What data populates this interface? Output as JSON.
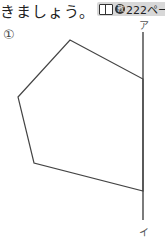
{
  "header": {
    "text": "きましょう。",
    "reference": {
      "icon": "book-icon",
      "mark": "教",
      "page": "222ペー"
    }
  },
  "problem": {
    "number": "①",
    "line_labels": {
      "top": "ア",
      "bottom": "イ"
    },
    "polygon_points": "70,40 143,79 143,191 34,163 18,97",
    "line": {
      "x": 143,
      "y1": 32,
      "y2": 220
    },
    "stroke_color": "#444444"
  }
}
